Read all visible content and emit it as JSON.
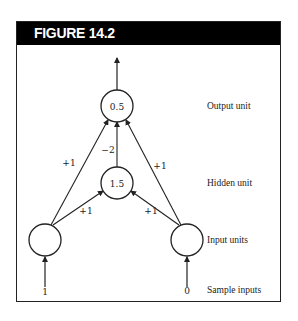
{
  "figure": {
    "title": "FIGURE 14.2"
  },
  "nodes": {
    "output": {
      "value": "0.5"
    },
    "hidden": {
      "value": "1.5"
    },
    "input_left": {
      "value": ""
    },
    "input_right": {
      "value": ""
    }
  },
  "weights": {
    "left_input_to_output": "+1",
    "right_input_to_output": "+1",
    "hidden_to_output": "−2",
    "left_input_to_hidden": "+1",
    "right_input_to_hidden": "+1"
  },
  "sample_inputs": {
    "left": "1",
    "right": "0"
  },
  "labels": {
    "output_unit": "Output unit",
    "hidden_unit": "Hidden unit",
    "input_units": "Input units",
    "sample_inputs": "Sample inputs"
  },
  "colors": {
    "header_bg": "#000000",
    "header_text": "#ffffff",
    "line": "#222222"
  }
}
